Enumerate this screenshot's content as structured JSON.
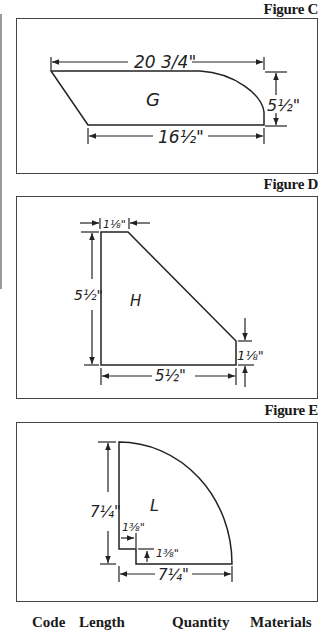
{
  "figures": [
    {
      "label": "Figure C",
      "part": "G",
      "dims": {
        "top": "20 3/4\"",
        "right": "5½\"",
        "bottom": "16½\""
      }
    },
    {
      "label": "Figure D",
      "part": "H",
      "dims": {
        "top": "1⅛\"",
        "left": "5½\"",
        "right": "1⅛\"",
        "bottom": "5½\""
      }
    },
    {
      "label": "Figure E",
      "part": "L",
      "dims": {
        "left": "7¼\"",
        "notch_width": "1⅜\"",
        "notch_height": "1⅜\"",
        "bottom": "7¼\""
      }
    }
  ],
  "table": {
    "headers": [
      "Code",
      "Length",
      "Quantity",
      "Materials"
    ]
  },
  "colors": {
    "line": "#222222",
    "border": "#444444"
  }
}
